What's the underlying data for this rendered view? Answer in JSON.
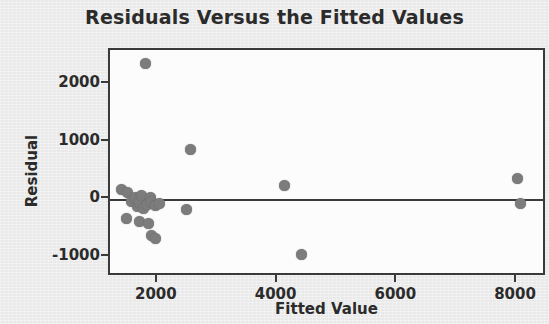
{
  "chart_data": {
    "type": "scatter",
    "title": "Residuals Versus the Fitted Values",
    "xlabel": "Fitted Value",
    "ylabel": "Residual",
    "xlim": [
      1200,
      8500
    ],
    "ylim": [
      -1350,
      2600
    ],
    "xticks": [
      2000,
      4000,
      6000,
      8000
    ],
    "xtick_labels": [
      "2000",
      "4000",
      "6000",
      "8000"
    ],
    "yticks": [
      2000,
      1000,
      0,
      -1000
    ],
    "ytick_labels": [
      "2000",
      "1000",
      "0",
      "-1000"
    ],
    "grid": false,
    "legend": null,
    "reference_line": {
      "axis": "y",
      "value": 0
    },
    "marker_color": "#7c7c7c",
    "frame_color": "#3a3a3a",
    "plot_background": "#fcfcfc",
    "figure_background": "#e9e9e9",
    "series": [
      {
        "name": "Residuals",
        "points": [
          {
            "x": 1800,
            "y": 2360
          },
          {
            "x": 2550,
            "y": 870
          },
          {
            "x": 1400,
            "y": 180
          },
          {
            "x": 1500,
            "y": 120
          },
          {
            "x": 1560,
            "y": -30
          },
          {
            "x": 1620,
            "y": 40
          },
          {
            "x": 1660,
            "y": -120
          },
          {
            "x": 1700,
            "y": -60
          },
          {
            "x": 1720,
            "y": 60
          },
          {
            "x": 1760,
            "y": -150
          },
          {
            "x": 1820,
            "y": -90
          },
          {
            "x": 1880,
            "y": 30
          },
          {
            "x": 1900,
            "y": -40
          },
          {
            "x": 1960,
            "y": -100
          },
          {
            "x": 2020,
            "y": -70
          },
          {
            "x": 1480,
            "y": -330
          },
          {
            "x": 1700,
            "y": -390
          },
          {
            "x": 1840,
            "y": -420
          },
          {
            "x": 1900,
            "y": -620
          },
          {
            "x": 1960,
            "y": -680
          },
          {
            "x": 2480,
            "y": -180
          },
          {
            "x": 4120,
            "y": 250
          },
          {
            "x": 4400,
            "y": -950
          },
          {
            "x": 8000,
            "y": 370
          },
          {
            "x": 8060,
            "y": -70
          }
        ]
      }
    ]
  }
}
